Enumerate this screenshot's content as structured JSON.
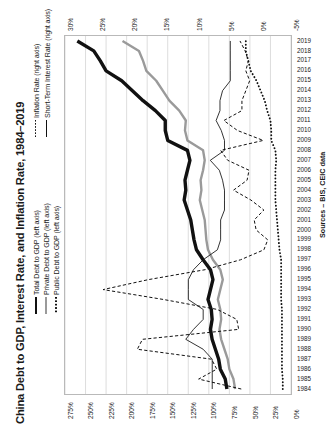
{
  "chart_data": {
    "type": "line",
    "title": "China Debt to GDP, Interest Rate, and Inflation Rate, 1984–2019",
    "orientation": "rotated-90-ccw",
    "source": "Sources – BIS, CEIC data",
    "xlabel": "",
    "ylabel_left": "",
    "ylabel_right": "",
    "grid": true,
    "legend_position": "top-left",
    "left_axis": {
      "ticks": [
        "275%",
        "250%",
        "225%",
        "200%",
        "175%",
        "150%",
        "125%",
        "100%",
        "75%",
        "50%",
        "25%",
        "0%"
      ],
      "min": 0,
      "max": 275,
      "step": 25,
      "unit": "%"
    },
    "right_axis": {
      "ticks": [
        "30%",
        "25%",
        "20%",
        "15%",
        "10%",
        "5%",
        "0%",
        "-5%"
      ],
      "min": -5,
      "max": 30,
      "step": 5,
      "unit": "%"
    },
    "categories": [
      1984,
      1985,
      1986,
      1987,
      1988,
      1989,
      1990,
      1991,
      1992,
      1993,
      1994,
      1995,
      1996,
      1997,
      1998,
      1999,
      2000,
      2001,
      2002,
      2003,
      2004,
      2005,
      2006,
      2007,
      2008,
      2009,
      2010,
      2011,
      2012,
      2013,
      2014,
      2015,
      2016,
      2017,
      2018,
      2019
    ],
    "series": [
      {
        "name": "Total Debt to GDP (left axis)",
        "axis": "left",
        "style": "solid-thick",
        "color": "#111111",
        "values": [
          78,
          80,
          86,
          88,
          92,
          96,
          98,
          96,
          97,
          101,
          98,
          95,
          98,
          107,
          115,
          118,
          120,
          122,
          126,
          130,
          128,
          129,
          126,
          123,
          126,
          150,
          153,
          153,
          165,
          180,
          193,
          206,
          225,
          232,
          240,
          260
        ]
      },
      {
        "name": "Private Debt to GDP (left axis)",
        "axis": "left",
        "style": "solid-grey",
        "color": "#9a9a9a",
        "values": [
          68,
          70,
          75,
          77,
          81,
          85,
          87,
          85,
          86,
          89,
          86,
          83,
          86,
          95,
          101,
          103,
          104,
          105,
          108,
          111,
          109,
          110,
          107,
          105,
          107,
          126,
          129,
          128,
          136,
          148,
          156,
          164,
          176,
          180,
          185,
          205
        ]
      },
      {
        "name": "Public Debt to GDP (left axis)",
        "axis": "left",
        "style": "dotted",
        "color": "#111111",
        "values": [
          10,
          10,
          11,
          11,
          11,
          11,
          11,
          11,
          11,
          12,
          12,
          12,
          12,
          12,
          14,
          15,
          16,
          17,
          18,
          19,
          19,
          19,
          19,
          18,
          19,
          24,
          24,
          25,
          29,
          32,
          37,
          42,
          49,
          52,
          55,
          55
        ]
      },
      {
        "name": "Inflation Rate (right axis)",
        "axis": "right",
        "style": "dashed",
        "color": "#111111",
        "values": [
          2.7,
          9.3,
          6.5,
          7.3,
          18.8,
          18.0,
          3.1,
          3.4,
          6.4,
          14.7,
          24.1,
          17.1,
          8.3,
          2.8,
          -0.8,
          -1.4,
          0.4,
          0.7,
          -0.8,
          1.2,
          3.9,
          1.8,
          1.5,
          4.8,
          5.9,
          -0.7,
          3.3,
          5.4,
          2.6,
          2.6,
          2.0,
          1.4,
          2.0,
          1.6,
          2.1,
          2.9
        ]
      },
      {
        "name": "Short-Term Interest Rate (right axis)",
        "axis": "right",
        "style": "thin-solid",
        "color": "#111111",
        "values": [
          7.2,
          7.2,
          7.2,
          7.2,
          8.6,
          11.3,
          10.1,
          8.6,
          8.6,
          10.9,
          10.9,
          10.9,
          10.1,
          8.6,
          6.4,
          5.9,
          5.9,
          5.9,
          5.3,
          5.3,
          5.3,
          5.6,
          6.1,
          7.5,
          5.3,
          5.3,
          5.8,
          6.6,
          6.0,
          6.0,
          5.6,
          4.4,
          4.4,
          4.4,
          4.4,
          4.4
        ]
      }
    ]
  },
  "legend": {
    "items": [
      {
        "label": "Total Debt to GDP (left axis)",
        "key": "solid-thick"
      },
      {
        "label": "Private Debt to GDP (left axis)",
        "key": "solid-grey"
      },
      {
        "label": "Public Debt to GDP (left axis)",
        "key": "dotted"
      },
      {
        "label": "Inflation Rate (right axis)",
        "key": "dashed"
      },
      {
        "label": "Short-Term Interest Rate (right axis)",
        "key": "thin-solid"
      }
    ]
  }
}
